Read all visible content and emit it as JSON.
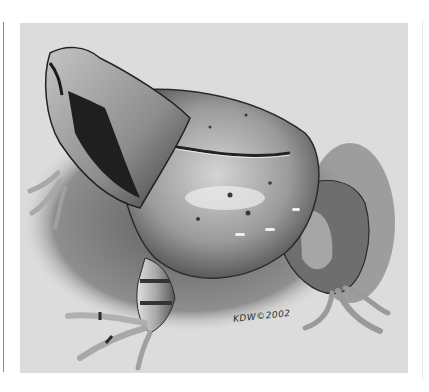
{
  "illustration": {
    "subject": "horned frog (pencil illustration)",
    "signature": "KDW©2002",
    "colors": {
      "page_background": "#ffffff",
      "panel_background": "#dcdcdc",
      "frog_body_light": "#c8c8c8",
      "frog_body_mid": "#8a8a8a",
      "frog_shadow": "#2e2e2e",
      "ground_shadow": "#7a7a7a"
    }
  }
}
